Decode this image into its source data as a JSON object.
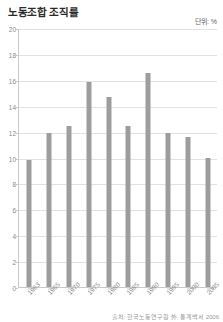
{
  "chart_data": {
    "type": "bar",
    "title": "노동조합 조직률",
    "unit_label": "단위: %",
    "xlabel": "",
    "ylabel": "",
    "categories": [
      "1963",
      "1965",
      "1970",
      "1975",
      "1980",
      "1985",
      "1990",
      "1995",
      "2000",
      "2005"
    ],
    "x": [
      "1963",
      "1965",
      "1970",
      "1975",
      "1980",
      "1985",
      "1990",
      "1995",
      "2000",
      "2005"
    ],
    "bars": [
      {
        "label": "1963",
        "value": 9.8
      },
      {
        "label": "1965",
        "value": 11.9
      },
      {
        "label": "1970",
        "value": 12.4
      },
      {
        "label": "1975",
        "value": 15.8
      },
      {
        "label": "1980",
        "value": 14.7
      },
      {
        "label": "1985",
        "value": 12.4
      },
      {
        "label": "1990",
        "value": 16.5
      },
      {
        "label": "1995",
        "value": 11.9
      },
      {
        "label": "2000",
        "value": 11.6
      },
      {
        "label": "2005",
        "value": 10.0
      }
    ],
    "values": [
      9.8,
      11.9,
      12.4,
      15.8,
      14.7,
      12.4,
      16.5,
      11.9,
      11.6,
      10.0
    ],
    "yticks": [
      0,
      2,
      4,
      6,
      8,
      10,
      12,
      14,
      16,
      18,
      20
    ],
    "ylim": [
      0,
      20
    ],
    "grid": true,
    "legend": false,
    "bar_color": "#9d9d9d",
    "grid_color": "#e2e2e2",
    "axis_color": "#c9c9c9",
    "source": "출처: 한국노동연구원 外, 통계백서 2006"
  }
}
